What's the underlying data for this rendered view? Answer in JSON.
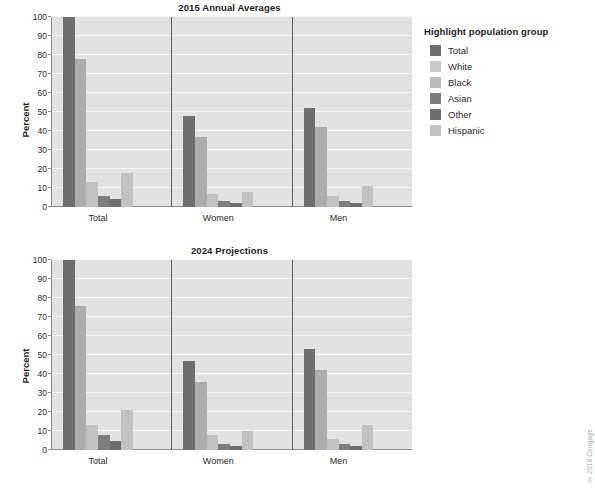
{
  "chart_data": [
    {
      "type": "bar",
      "title": "2015 Annual Averages",
      "xlabel": "",
      "ylabel": "Percent",
      "ylim": [
        0,
        100
      ],
      "yticks": [
        0,
        10,
        20,
        30,
        40,
        50,
        60,
        70,
        80,
        90,
        100
      ],
      "grid": true,
      "legend_position": "right",
      "categories": [
        "Total",
        "Women",
        "Men"
      ],
      "series": [
        {
          "name": "Total",
          "color": "#6e6e6e",
          "values": [
            100,
            48,
            52
          ]
        },
        {
          "name": "White",
          "color": "#adadad",
          "values": [
            78,
            37,
            42
          ]
        },
        {
          "name": "Black",
          "color": "#c2c2c2",
          "values": [
            13,
            7,
            6
          ]
        },
        {
          "name": "Asian",
          "color": "#7d7d7d",
          "values": [
            6,
            3,
            3
          ]
        },
        {
          "name": "Other",
          "color": "#6e6e6e",
          "values": [
            4,
            2,
            2
          ]
        },
        {
          "name": "Hispanic",
          "color": "#c2c2c2",
          "values": [
            18,
            8,
            11
          ]
        }
      ]
    },
    {
      "type": "bar",
      "title": "2024 Projections",
      "xlabel": "",
      "ylabel": "Percent",
      "ylim": [
        0,
        100
      ],
      "yticks": [
        0,
        10,
        20,
        30,
        40,
        50,
        60,
        70,
        80,
        90,
        100
      ],
      "grid": true,
      "legend_position": "right",
      "categories": [
        "Total",
        "Women",
        "Men"
      ],
      "series": [
        {
          "name": "Total",
          "color": "#6e6e6e",
          "values": [
            100,
            47,
            53
          ]
        },
        {
          "name": "White",
          "color": "#adadad",
          "values": [
            76,
            36,
            42
          ]
        },
        {
          "name": "Black",
          "color": "#c2c2c2",
          "values": [
            13,
            8,
            6
          ]
        },
        {
          "name": "Asian",
          "color": "#7d7d7d",
          "values": [
            8,
            3,
            3
          ]
        },
        {
          "name": "Other",
          "color": "#6e6e6e",
          "values": [
            5,
            2,
            2
          ]
        },
        {
          "name": "Hispanic",
          "color": "#c2c2c2",
          "values": [
            21,
            10,
            13
          ]
        }
      ]
    }
  ],
  "legend": {
    "title": "Highlight population group",
    "items": [
      {
        "label": "Total",
        "color": "#6e6e6e"
      },
      {
        "label": "White",
        "color": "#c9c9c9"
      },
      {
        "label": "Black",
        "color": "#bcbcbc"
      },
      {
        "label": "Asian",
        "color": "#7d7d7d"
      },
      {
        "label": "Other",
        "color": "#6e6e6e"
      },
      {
        "label": "Hispanic",
        "color": "#c2c2c2"
      }
    ]
  },
  "watermark": "© 2018 Cengage",
  "colors": {
    "plot_background": "#e2e2e2",
    "gridline": "#f7f7f7",
    "axis": "#8d8d8d",
    "separator": "#5c5c5c",
    "text": "#2a2a2a"
  }
}
